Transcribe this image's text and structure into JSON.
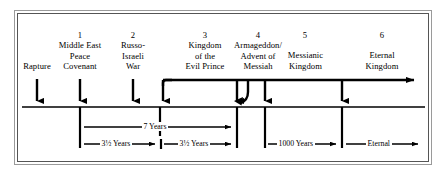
{
  "diagram": {
    "border_color": "#555555",
    "line_color": "#000000",
    "events": [
      {
        "number": "",
        "lines": [
          "Rapture"
        ],
        "label_x": 37,
        "num_x": 37,
        "arrow_x": 37
      },
      {
        "number": "1",
        "lines": [
          "Middle East",
          "Peace",
          "Covenant"
        ],
        "label_x": 80,
        "num_x": 80,
        "arrow_x": 80
      },
      {
        "number": "2",
        "lines": [
          "Russo-",
          "Israeli",
          "War"
        ],
        "label_x": 133,
        "num_x": 133,
        "arrow_x": 133
      },
      {
        "number": "3",
        "lines": [
          "Kingdom",
          "of the",
          "Evil Prince"
        ],
        "label_x": 205,
        "num_x": 205,
        "arrow_x": 160
      },
      {
        "number": "4",
        "lines": [
          "Armageddon/",
          "Advent of",
          "Messiah"
        ],
        "label_x": 258,
        "num_x": 258,
        "arrow_x": 237
      },
      {
        "number": "5",
        "lines": [
          "Messianic",
          "Kingdom"
        ],
        "label_x": 305,
        "num_x": 305,
        "arrow_x": 265
      },
      {
        "number": "6",
        "lines": [
          "Eternal",
          "Kingdom"
        ],
        "label_x": 382,
        "num_x": 382,
        "arrow_x": 342
      }
    ],
    "durations": [
      {
        "text": "7 Years",
        "row": 1,
        "x1": 80,
        "x2": 237,
        "center": 158
      },
      {
        "text": "3½ Years",
        "row": 2,
        "x1": 80,
        "x2": 160,
        "center": 120
      },
      {
        "text": "3½ Years",
        "row": 2,
        "x1": 160,
        "x2": 237,
        "center": 199
      },
      {
        "text": "1000 Years",
        "row": 2,
        "x1": 265,
        "x2": 342,
        "center": 303
      },
      {
        "text": "Eternal",
        "row": 2,
        "x1": 342,
        "x2": 420,
        "center": 383
      }
    ],
    "axis": {
      "main_line_y": 80,
      "baseline_y": 107,
      "arrow_head": "right-arrowhead",
      "terminal_x": 420
    }
  }
}
